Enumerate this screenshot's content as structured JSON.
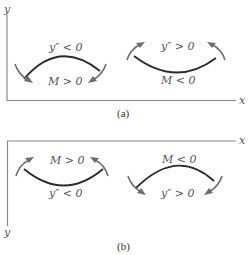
{
  "figure": {
    "panel_a": {
      "caption": "(a)",
      "x_axis_label": "x",
      "y_axis_label": "y",
      "hogging": {
        "top_label": "y″ < 0",
        "bottom_label": "M > 0"
      },
      "sagging": {
        "top_label": "y″ > 0",
        "bottom_label": "M < 0"
      }
    },
    "panel_b": {
      "caption": "(b)",
      "x_axis_label": "x",
      "y_axis_label": "y",
      "sagging": {
        "top_label": "M > 0",
        "bottom_label": "y″ < 0"
      },
      "hogging": {
        "top_label": "M < 0",
        "bottom_label": "y″ > 0"
      }
    }
  },
  "colors": {
    "axis": "#8a8a8a",
    "curve": "#2a2a2a",
    "arrow": "#6e6e6e",
    "text": "#555555"
  }
}
